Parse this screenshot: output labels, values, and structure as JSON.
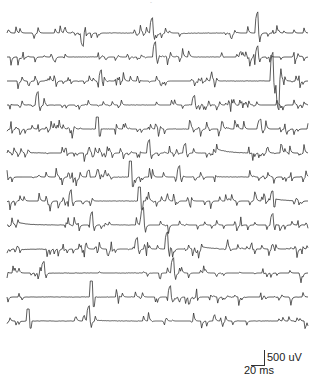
{
  "chart_data": {
    "type": "line",
    "title": "",
    "xlabel": "",
    "ylabel": "",
    "grid": false,
    "legend": null,
    "n_traces": 13,
    "trace_color": "#333333",
    "x_range_px": [
      7,
      308
    ],
    "baselines_px": [
      33,
      57,
      81,
      105,
      129,
      153,
      177,
      201,
      225,
      249,
      273,
      297,
      321
    ],
    "traces": [
      {
        "seed": 11,
        "flat": [
          [
            0.58,
            0.72
          ],
          [
            0.33,
            0.42
          ]
        ],
        "big": [
          [
            0.25,
            -14
          ],
          [
            0.48,
            16
          ],
          [
            0.83,
            22
          ]
        ]
      },
      {
        "seed": 23,
        "flat": [
          [
            0.22,
            0.3
          ],
          [
            0.62,
            0.7
          ]
        ],
        "big": [
          [
            0.49,
            16
          ],
          [
            0.83,
            12
          ]
        ]
      },
      {
        "seed": 37,
        "flat": [
          [
            0.72,
            0.86
          ]
        ],
        "big": [
          [
            0.31,
            12
          ],
          [
            0.88,
            30
          ],
          [
            0.9,
            -30
          ]
        ]
      },
      {
        "seed": 41,
        "flat": [
          [
            0.4,
            0.47
          ]
        ],
        "big": [
          [
            0.1,
            14
          ],
          [
            0.62,
            10
          ]
        ]
      },
      {
        "seed": 53,
        "flat": [
          [
            0.27,
            0.34
          ],
          [
            0.55,
            0.6
          ]
        ],
        "big": [
          [
            0.3,
            12
          ],
          [
            0.84,
            10
          ]
        ]
      },
      {
        "seed": 67,
        "flat": [
          [
            0.08,
            0.13
          ],
          [
            0.7,
            0.8
          ]
        ],
        "big": [
          [
            0.47,
            14
          ],
          [
            0.59,
            10
          ]
        ]
      },
      {
        "seed": 71,
        "flat": [
          [
            0.36,
            0.42
          ],
          [
            0.7,
            0.8
          ]
        ],
        "big": [
          [
            0.41,
            16
          ],
          [
            0.57,
            12
          ]
        ]
      },
      {
        "seed": 83,
        "flat": [
          [
            0.3,
            0.46
          ],
          [
            0.88,
            0.95
          ]
        ],
        "big": [
          [
            0.21,
            12
          ],
          [
            0.44,
            14
          ],
          [
            0.88,
            10
          ]
        ]
      },
      {
        "seed": 97,
        "flat": [
          [
            0.04,
            0.18
          ],
          [
            0.35,
            0.42
          ]
        ],
        "big": [
          [
            0.28,
            14
          ],
          [
            0.45,
            18
          ],
          [
            0.88,
            12
          ]
        ]
      },
      {
        "seed": 101,
        "flat": [
          [
            0.05,
            0.12
          ],
          [
            0.65,
            0.7
          ]
        ],
        "big": [
          [
            0.43,
            12
          ],
          [
            0.53,
            18
          ]
        ]
      },
      {
        "seed": 113,
        "flat": [
          [
            0.14,
            0.28
          ],
          [
            0.35,
            0.44
          ]
        ],
        "big": [
          [
            0.12,
            12
          ],
          [
            0.55,
            16
          ]
        ]
      },
      {
        "seed": 127,
        "flat": [
          [
            0.07,
            0.22
          ],
          [
            0.24,
            0.34
          ]
        ],
        "big": [
          [
            0.28,
            16
          ],
          [
            0.54,
            12
          ]
        ]
      },
      {
        "seed": 131,
        "flat": [
          [
            0.05,
            0.22
          ],
          [
            0.3,
            0.44
          ],
          [
            0.82,
            0.88
          ]
        ],
        "big": [
          [
            0.07,
            12
          ],
          [
            0.27,
            16
          ]
        ]
      }
    ],
    "scale_bar": {
      "vertical_label": "500 uV",
      "horizontal_label": "20 ms"
    }
  },
  "header": {
    "title_fragment": "-"
  }
}
